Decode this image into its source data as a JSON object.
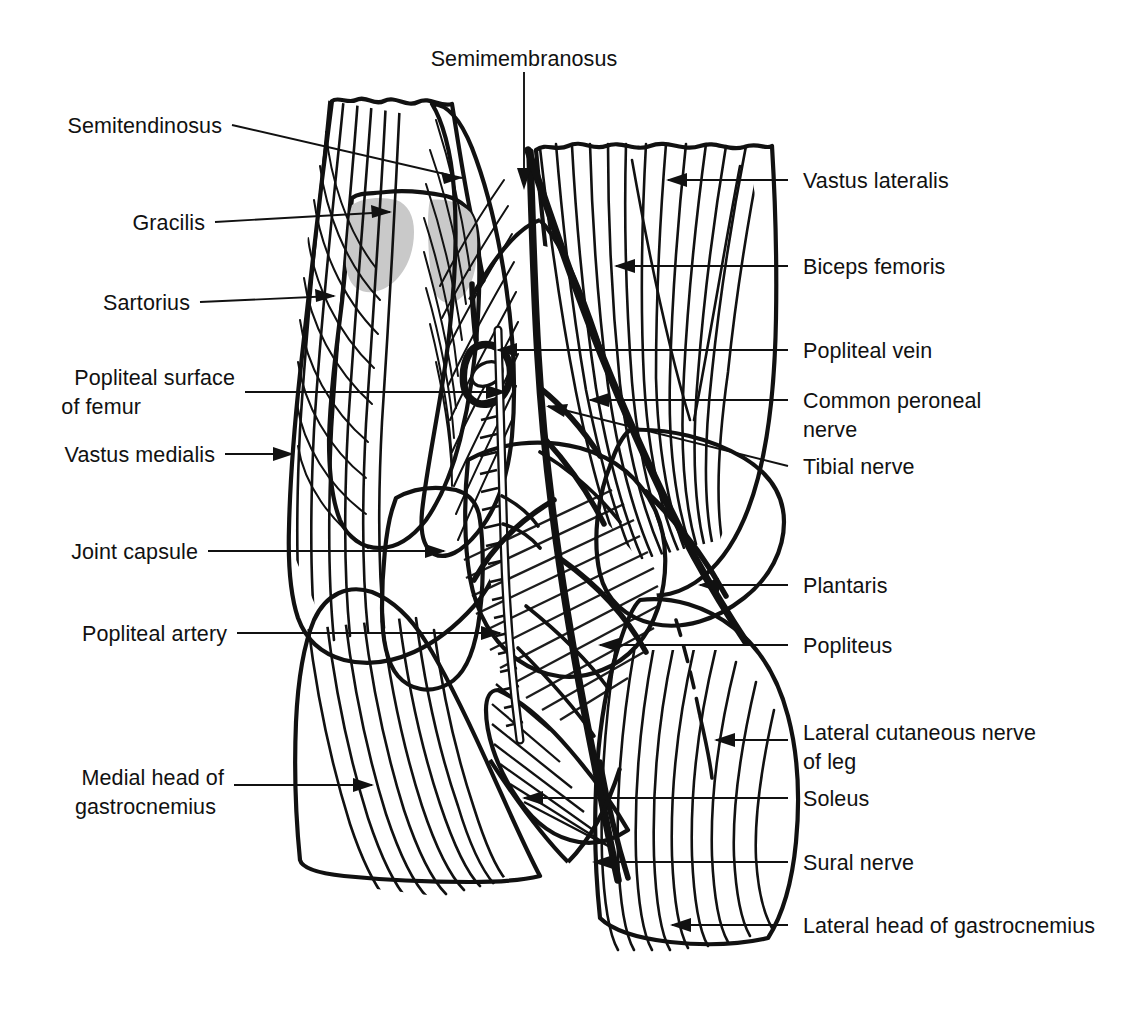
{
  "figure": {
    "colors": {
      "ink": "#111111",
      "background": "#ffffff",
      "light_gray": "#c9c9c9",
      "mid_gray": "#9e9e9e",
      "dark_gray": "#7d7d7d",
      "halftone_gray": "#8c8c8c",
      "pale_gray": "#dedede"
    },
    "labels_left": [
      {
        "id": "semitendinosus",
        "text": "Semitendinosus",
        "lines": [
          "Semitendinosus"
        ]
      },
      {
        "id": "gracilis",
        "text": "Gracilis",
        "lines": [
          "Gracilis"
        ]
      },
      {
        "id": "sartorius",
        "text": "Sartorius",
        "lines": [
          "Sartorius"
        ]
      },
      {
        "id": "popliteal-surface-of-femur",
        "text": "Popliteal surface of femur",
        "lines": [
          "Popliteal surface",
          "of femur"
        ]
      },
      {
        "id": "vastus-medialis",
        "text": "Vastus medialis",
        "lines": [
          "Vastus medialis"
        ]
      },
      {
        "id": "joint-capsule",
        "text": "Joint capsule",
        "lines": [
          "Joint capsule"
        ]
      },
      {
        "id": "popliteal-artery",
        "text": "Popliteal artery",
        "lines": [
          "Popliteal artery"
        ]
      },
      {
        "id": "medial-head-of-gastrocnemius",
        "text": "Medial head of gastrocnemius",
        "lines": [
          "Medial head of",
          "gastrocnemius"
        ]
      }
    ],
    "labels_top": [
      {
        "id": "semimembranosus",
        "text": "Semimembranosus",
        "lines": [
          "Semimembranosus"
        ]
      }
    ],
    "labels_right": [
      {
        "id": "vastus-lateralis",
        "text": "Vastus lateralis",
        "lines": [
          "Vastus lateralis"
        ]
      },
      {
        "id": "biceps-femoris",
        "text": "Biceps femoris",
        "lines": [
          "Biceps femoris"
        ]
      },
      {
        "id": "popliteal-vein",
        "text": "Popliteal vein",
        "lines": [
          "Popliteal vein"
        ]
      },
      {
        "id": "common-peroneal-nerve",
        "text": "Common peroneal nerve",
        "lines": [
          "Common peroneal",
          "nerve"
        ]
      },
      {
        "id": "tibial-nerve",
        "text": "Tibial nerve",
        "lines": [
          "Tibial nerve"
        ]
      },
      {
        "id": "plantaris",
        "text": "Plantaris",
        "lines": [
          "Plantaris"
        ]
      },
      {
        "id": "popliteus",
        "text": "Popliteus",
        "lines": [
          "Popliteus"
        ]
      },
      {
        "id": "lateral-cutaneous-nerve-of-leg",
        "text": "Lateral cutaneous nerve of leg",
        "lines": [
          "Lateral cutaneous nerve",
          "of leg"
        ]
      },
      {
        "id": "soleus",
        "text": "Soleus",
        "lines": [
          "Soleus"
        ]
      },
      {
        "id": "sural-nerve",
        "text": "Sural nerve",
        "lines": [
          "Sural nerve"
        ]
      },
      {
        "id": "lateral-head-of-gastrocnemius",
        "text": "Lateral head of gastrocnemius",
        "lines": [
          "Lateral head of gastrocnemius"
        ]
      }
    ]
  }
}
